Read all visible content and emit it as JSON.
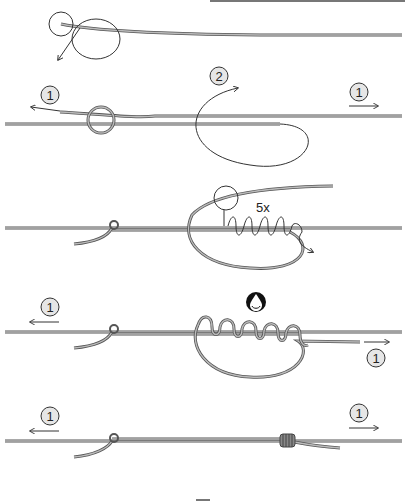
{
  "diagram": {
    "type": "fishing knot tying instructions",
    "colors": {
      "line_dark": "#555555",
      "line_light": "#bdbdbd",
      "badge_fill": "#e6e6e6",
      "badge_stroke": "#333333",
      "water_badge": "#111111"
    },
    "steps": [
      {
        "id": 1,
        "description": "tag end forms loop",
        "badges": []
      },
      {
        "id": 2,
        "description": "overhand knot, tag passes loop",
        "badges": [
          {
            "text": "1",
            "position": "left"
          },
          {
            "text": "2",
            "position": "center"
          },
          {
            "text": "1",
            "position": "right"
          }
        ]
      },
      {
        "id": 3,
        "description": "wrap tag around main line",
        "wrap_label": "5x",
        "badges": []
      },
      {
        "id": 4,
        "description": "moisten and tighten wraps",
        "icon": "water-drop-icon",
        "badges": [
          {
            "text": "1",
            "position": "left"
          },
          {
            "text": "1",
            "position": "bottom-right"
          }
        ]
      },
      {
        "id": 5,
        "description": "finished knot",
        "badges": [
          {
            "text": "1",
            "position": "left"
          },
          {
            "text": "1",
            "position": "right"
          }
        ]
      }
    ]
  }
}
